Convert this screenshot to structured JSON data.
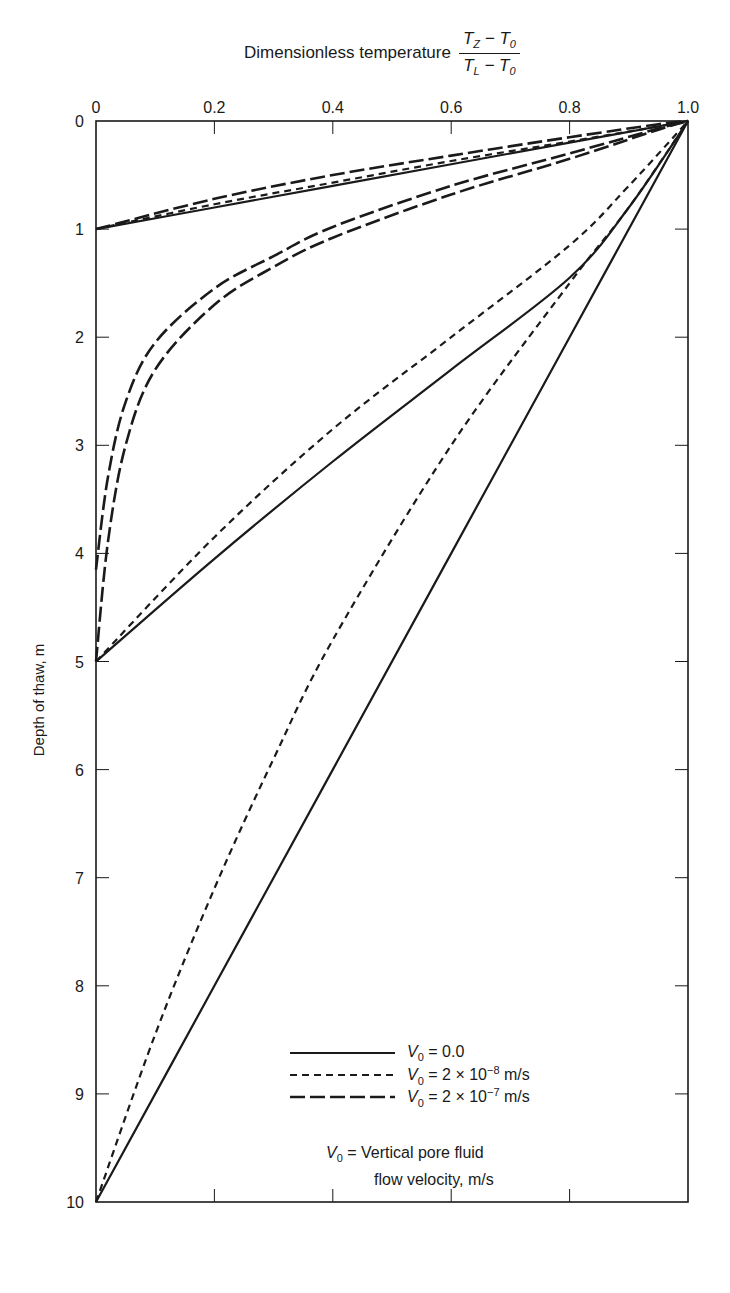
{
  "chart_data": {
    "type": "line",
    "title_text": "Dimensionless temperature",
    "title_fraction": {
      "numerator": "T_Z − T_0",
      "denominator": "T_L − T_0"
    },
    "xlabel": "Dimensionless temperature (T_Z − T_0)/(T_L − T_0)",
    "ylabel": "Depth of thaw, m",
    "x_axis_position": "top",
    "y_axis_inverted": true,
    "xlim": [
      0,
      1.0
    ],
    "ylim": [
      0,
      10
    ],
    "x_ticks": [
      "0",
      "0.2",
      "0.4",
      "0.6",
      "0.8",
      "1.0"
    ],
    "y_ticks": [
      "0",
      "1",
      "2",
      "3",
      "4",
      "5",
      "6",
      "7",
      "8",
      "9",
      "10"
    ],
    "grid": false,
    "legend_position": "lower right (inside)",
    "legend": [
      {
        "style": "solid",
        "label": "V0 = 0.0"
      },
      {
        "style": "short-dash",
        "label": "V0 = 2 × 10^-8 m/s"
      },
      {
        "style": "long-dash",
        "label": "V0 = 2 × 10^-7 m/s"
      }
    ],
    "annotation": "V0 = Vertical pore fluid flow velocity, m/s",
    "series": [
      {
        "name": "V0 = 0.0, thaw depth 1 m",
        "style": "solid",
        "x": [
          0,
          0.2,
          0.4,
          0.6,
          0.8,
          1.0
        ],
        "y": [
          1.0,
          0.8,
          0.6,
          0.4,
          0.2,
          0.0
        ]
      },
      {
        "name": "V0 = 2e-8 m/s, thaw depth 1 m",
        "style": "short-dash",
        "x": [
          0,
          0.2,
          0.4,
          0.6,
          0.8,
          0.95,
          1.0
        ],
        "y": [
          1.0,
          0.77,
          0.57,
          0.37,
          0.19,
          0.05,
          0.0
        ]
      },
      {
        "name": "V0 = 2e-7 m/s, thaw depth 1 m",
        "style": "long-dash",
        "x": [
          0,
          0.2,
          0.4,
          0.6,
          0.8,
          0.95,
          1.0
        ],
        "y": [
          1.0,
          0.72,
          0.5,
          0.32,
          0.15,
          0.03,
          0.0
        ]
      },
      {
        "name": "V0 = 0.0, thaw depth 5 m",
        "style": "solid",
        "x": [
          0,
          0.2,
          0.4,
          0.6,
          0.8,
          0.9,
          1.0
        ],
        "y": [
          5.0,
          4.05,
          3.15,
          2.3,
          1.45,
          0.8,
          0.0
        ]
      },
      {
        "name": "V0 = 2e-8 m/s, thaw depth 5 m",
        "style": "short-dash",
        "x": [
          0,
          0.2,
          0.4,
          0.6,
          0.8,
          0.9,
          1.0
        ],
        "y": [
          5.0,
          3.85,
          2.85,
          2.0,
          1.15,
          0.6,
          0.0
        ]
      },
      {
        "name": "V0 = 2e-7 m/s, thaw depth 5 m (curve A)",
        "style": "long-dash",
        "x": [
          0,
          0.02,
          0.05,
          0.1,
          0.2,
          0.3,
          0.4,
          0.6,
          0.8,
          0.95,
          1.0
        ],
        "y": [
          4.15,
          3.3,
          2.6,
          2.05,
          1.55,
          1.25,
          0.98,
          0.6,
          0.3,
          0.07,
          0.0
        ]
      },
      {
        "name": "V0 = 2e-7 m/s, thaw depth 5 m (curve B)",
        "style": "long-dash",
        "x": [
          0,
          0.02,
          0.05,
          0.1,
          0.2,
          0.3,
          0.4,
          0.6,
          0.8,
          0.95,
          1.0
        ],
        "y": [
          5.0,
          3.9,
          3.0,
          2.3,
          1.7,
          1.35,
          1.08,
          0.68,
          0.35,
          0.08,
          0.0
        ]
      },
      {
        "name": "V0 = 0.0, thaw depth 10 m",
        "style": "solid",
        "x": [
          0,
          0.2,
          0.4,
          0.6,
          0.8,
          1.0
        ],
        "y": [
          10.0,
          8.0,
          6.0,
          4.0,
          2.0,
          0.0
        ]
      },
      {
        "name": "V0 = 2e-8 m/s, thaw depth 10 m",
        "style": "short-dash",
        "x": [
          0,
          0.1,
          0.2,
          0.3,
          0.4,
          0.6,
          0.8,
          0.9,
          1.0
        ],
        "y": [
          10.0,
          8.45,
          7.1,
          5.9,
          4.8,
          3.0,
          1.5,
          0.8,
          0.0
        ]
      }
    ]
  },
  "title": {
    "text": "Dimensionless temperature",
    "num_a": "T",
    "num_a_sub": "Z",
    "num_op": " − ",
    "num_b": "T",
    "num_b_sub": "0",
    "den_a": "T",
    "den_a_sub": "L",
    "den_op": " − ",
    "den_b": "T",
    "den_b_sub": "0"
  },
  "axes": {
    "ylabel": "Depth of thaw, m"
  },
  "legend": {
    "items": [
      {
        "v": "V",
        "sub": "0",
        "eq": " = 0.0",
        "exp": "",
        "unit": ""
      },
      {
        "v": "V",
        "sub": "0",
        "eq": " = 2 × 10",
        "exp": "−8",
        "unit": " m/s"
      },
      {
        "v": "V",
        "sub": "0",
        "eq": " = 2 × 10",
        "exp": "−7",
        "unit": " m/s"
      }
    ]
  },
  "note": {
    "v": "V",
    "sub": "0",
    "line1": " = Vertical pore fluid",
    "line2": "flow velocity, m/s"
  },
  "colors": {
    "ink": "#1a1a1a",
    "background": "#ffffff"
  }
}
